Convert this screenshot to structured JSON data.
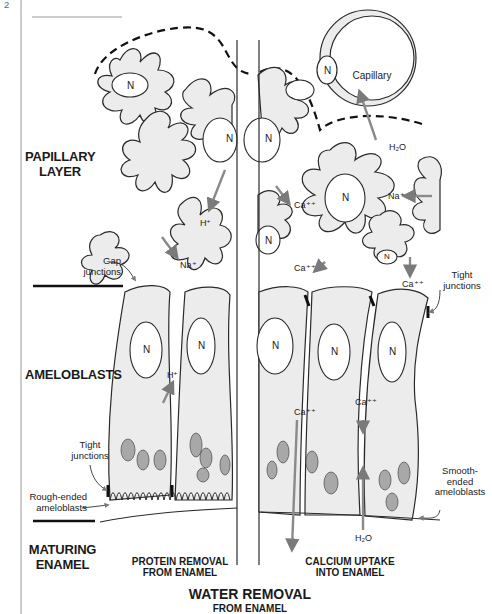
{
  "header": {
    "page_marker": "2",
    "running_title": "Oral Histology"
  },
  "sections": {
    "papillary_layer": "PAPILLARY\nLAYER",
    "ameloblasts": "AMELOBLASTS",
    "maturing_enamel": "MATURING\nENAMEL"
  },
  "callouts": {
    "gap_junctions": "Gap\njunctions",
    "tight_junctions_left": "Tight\njunctions",
    "rough_ended": "Rough-ended\nameloblasts",
    "tight_junctions_right": "Tight\njunctions",
    "smooth_ended": "Smooth-\nended\nameloblasts",
    "capillary": "Capillary"
  },
  "nucleus_label": "N",
  "ions": {
    "h_plus_papillary": "H⁺",
    "na_plus_left": "Na⁺",
    "h_plus_ameloblast": "H⁺",
    "ca_upper": "Ca⁺⁺",
    "ca_lower": "Ca⁺⁺",
    "na_plus_right": "Na⁺",
    "h2o_capillary": "H₂O",
    "ca_right_top": "Ca⁺⁺",
    "ca_cell_left": "Ca⁺⁺",
    "ca_cell_right": "Ca⁺⁺",
    "h2o_bottom": "H₂O"
  },
  "bottom_captions": {
    "protein_removal": "PROTEIN REMOVAL\nFROM ENAMEL",
    "calcium_uptake": "CALCIUM UPTAKE\nINTO ENAMEL",
    "water_removal": "WATER REMOVAL",
    "water_removal_sub": "FROM ENAMEL"
  },
  "colors": {
    "cell_fill": "#ececec",
    "line": "#2a2a2a",
    "arrow": "#8a8a8a",
    "mito": "#9a9a9a"
  }
}
